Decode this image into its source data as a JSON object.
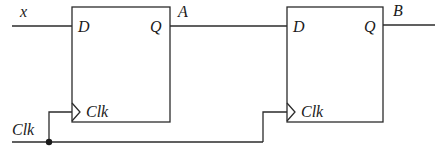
{
  "diagram": {
    "type": "circuit",
    "colors": {
      "line": "#2b2b2b",
      "text": "#1a1a1a",
      "background": "#ffffff"
    },
    "inputs": {
      "x": "x",
      "clock": "Clk"
    },
    "flip_flops": [
      {
        "id": "ff1",
        "d_label": "D",
        "q_label": "Q",
        "clk_label": "Clk",
        "output_name": "A"
      },
      {
        "id": "ff2",
        "d_label": "D",
        "q_label": "Q",
        "clk_label": "Clk",
        "output_name": "B"
      }
    ],
    "connections": [
      "x -> ff1.D",
      "ff1.Q (A) -> ff2.D",
      "ff2.Q -> B",
      "Clk -> ff1.Clk",
      "Clk -> ff2.Clk"
    ]
  }
}
